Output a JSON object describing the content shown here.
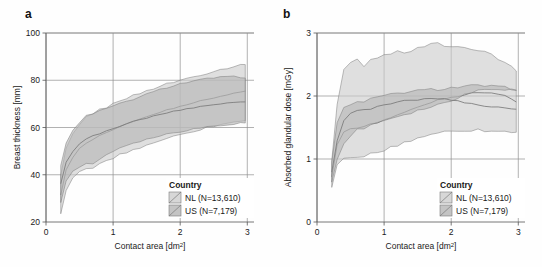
{
  "figure": {
    "panels": [
      {
        "letter": "a",
        "chart_data": {
          "type": "area",
          "title": "",
          "xlabel": "Contact area [dm²]",
          "ylabel": "Breast thickness [mm]",
          "xlim": [
            0,
            3.1
          ],
          "ylim": [
            20,
            100
          ],
          "xticks": [
            0,
            1,
            2,
            3
          ],
          "xtick_labels": [
            "0",
            "1",
            "2",
            "3"
          ],
          "yticks": [
            20,
            40,
            60,
            80,
            100
          ],
          "ytick_labels": [
            "20",
            "40",
            "60",
            "80",
            "100"
          ],
          "grid": true,
          "legend_position": "bottom-right",
          "x": [
            0.22,
            0.3,
            0.4,
            0.5,
            0.6,
            0.7,
            0.8,
            0.9,
            1.0,
            1.1,
            1.2,
            1.3,
            1.4,
            1.5,
            1.6,
            1.7,
            1.8,
            1.9,
            2.0,
            2.1,
            2.2,
            2.3,
            2.4,
            2.5,
            2.6,
            2.7,
            2.8,
            2.9,
            2.97
          ],
          "series": [
            {
              "name": "NL (N=13,610)",
              "median": [
                31.5,
                42.0,
                47.5,
                51.0,
                53.5,
                55.0,
                56.5,
                58.0,
                59.0,
                60.5,
                61.5,
                62.5,
                63.5,
                64.5,
                65.5,
                66.5,
                67.5,
                68.2,
                69.0,
                69.8,
                70.5,
                71.2,
                72.0,
                72.6,
                73.2,
                73.8,
                74.4,
                75.0,
                75.3
              ],
              "lower": [
                23.5,
                33.5,
                38.5,
                41.0,
                42.5,
                43.0,
                44.5,
                46.0,
                47.0,
                48.5,
                49.5,
                50.5,
                51.5,
                52.5,
                53.5,
                54.5,
                55.5,
                56.2,
                57.0,
                57.8,
                58.5,
                59.2,
                60.0,
                60.6,
                61.2,
                61.8,
                62.3,
                62.8,
                63.0
              ],
              "upper": [
                39.5,
                51.0,
                57.0,
                61.0,
                64.5,
                66.0,
                67.5,
                68.5,
                70.0,
                71.5,
                72.5,
                73.5,
                74.5,
                75.5,
                76.5,
                77.5,
                78.5,
                79.2,
                80.0,
                80.8,
                81.5,
                82.3,
                83.0,
                83.8,
                84.5,
                85.2,
                85.8,
                86.5,
                87.0
              ]
            },
            {
              "name": "US (N=7,179)",
              "median": [
                36.0,
                45.5,
                50.0,
                53.0,
                55.0,
                56.5,
                57.5,
                58.5,
                59.5,
                60.5,
                61.5,
                62.5,
                63.3,
                64.0,
                64.8,
                65.5,
                66.2,
                66.8,
                67.4,
                67.9,
                68.4,
                68.9,
                69.3,
                69.7,
                70.0,
                70.3,
                70.6,
                70.9,
                71.0
              ],
              "lower": [
                28.0,
                37.5,
                41.5,
                43.5,
                44.5,
                45.0,
                46.5,
                48.5,
                50.0,
                51.5,
                52.5,
                53.5,
                54.3,
                55.0,
                55.8,
                56.5,
                57.2,
                57.8,
                58.4,
                58.9,
                59.4,
                59.9,
                60.3,
                60.7,
                61.0,
                61.3,
                61.6,
                61.9,
                62.0
              ],
              "upper": [
                44.0,
                53.5,
                58.5,
                62.0,
                65.0,
                66.0,
                67.0,
                68.0,
                69.0,
                70.0,
                71.0,
                72.0,
                73.0,
                74.0,
                75.0,
                76.0,
                77.0,
                77.8,
                78.5,
                79.1,
                79.6,
                80.1,
                80.6,
                81.0,
                81.2,
                81.3,
                81.4,
                81.4,
                81.3
              ]
            }
          ]
        }
      },
      {
        "letter": "b",
        "chart_data": {
          "type": "area",
          "title": "",
          "xlabel": "Contact area [dm²]",
          "ylabel": "Absorbed glandular dose [mGy]",
          "xlim": [
            0,
            3.1
          ],
          "ylim": [
            0,
            3
          ],
          "xticks": [
            0,
            1,
            2,
            3
          ],
          "xtick_labels": [
            "0",
            "1",
            "2",
            "3"
          ],
          "yticks": [
            0,
            1,
            2,
            3
          ],
          "ytick_labels": [
            "0",
            "1",
            "2",
            "3"
          ],
          "grid": true,
          "legend_position": "bottom-right",
          "x": [
            0.22,
            0.3,
            0.4,
            0.5,
            0.6,
            0.7,
            0.8,
            0.9,
            1.0,
            1.1,
            1.2,
            1.3,
            1.4,
            1.5,
            1.6,
            1.7,
            1.8,
            1.9,
            2.0,
            2.1,
            2.2,
            2.3,
            2.4,
            2.5,
            2.6,
            2.7,
            2.8,
            2.9,
            2.97
          ],
          "series": [
            {
              "name": "NL (N=13,610)",
              "median": [
                0.72,
                1.22,
                1.44,
                1.47,
                1.5,
                1.52,
                1.55,
                1.58,
                1.62,
                1.66,
                1.7,
                1.74,
                1.78,
                1.82,
                1.86,
                1.9,
                1.94,
                1.96,
                1.98,
                2.0,
                2.02,
                2.04,
                2.06,
                2.06,
                2.05,
                2.03,
                2.0,
                1.95,
                1.9
              ],
              "lower": [
                0.55,
                0.92,
                1.0,
                1.0,
                1.02,
                1.05,
                1.08,
                1.1,
                1.14,
                1.18,
                1.22,
                1.26,
                1.3,
                1.33,
                1.36,
                1.4,
                1.42,
                1.43,
                1.44,
                1.45,
                1.46,
                1.46,
                1.46,
                1.45,
                1.44,
                1.44,
                1.44,
                1.43,
                1.43
              ],
              "upper": [
                0.95,
                1.85,
                2.4,
                2.52,
                2.58,
                2.48,
                2.56,
                2.62,
                2.64,
                2.68,
                2.74,
                2.66,
                2.72,
                2.76,
                2.8,
                2.84,
                2.83,
                2.8,
                2.78,
                2.78,
                2.77,
                2.76,
                2.74,
                2.72,
                2.66,
                2.6,
                2.54,
                2.46,
                2.42
              ]
            },
            {
              "name": "US (N=7,179)",
              "median": [
                0.78,
                1.3,
                1.62,
                1.72,
                1.76,
                1.78,
                1.8,
                1.83,
                1.86,
                1.88,
                1.9,
                1.92,
                1.93,
                1.94,
                1.95,
                1.96,
                1.96,
                1.95,
                1.94,
                1.92,
                1.9,
                1.88,
                1.86,
                1.84,
                1.83,
                1.82,
                1.81,
                1.8,
                1.8
              ],
              "lower": [
                0.62,
                1.0,
                1.24,
                1.38,
                1.46,
                1.5,
                1.54,
                1.58,
                1.62,
                1.65,
                1.68,
                1.71,
                1.74,
                1.77,
                1.8,
                1.83,
                1.86,
                1.9,
                1.94,
                1.98,
                2.02,
                2.06,
                2.09,
                2.11,
                2.12,
                2.12,
                2.11,
                2.1,
                2.1
              ],
              "upper": [
                0.95,
                1.58,
                1.8,
                1.86,
                1.9,
                1.92,
                1.95,
                1.98,
                2.0,
                2.02,
                2.04,
                2.06,
                2.07,
                2.08,
                2.09,
                2.1,
                2.11,
                2.12,
                2.13,
                2.14,
                2.15,
                2.16,
                2.16,
                2.16,
                2.15,
                2.14,
                2.13,
                2.12,
                2.11
              ]
            }
          ]
        }
      }
    ],
    "legend": {
      "title": "Country",
      "entries": [
        {
          "label": "NL (N=13,610)",
          "swatch_color": "#c9c9c9"
        },
        {
          "label": "US (N=7,179)",
          "swatch_color": "#b0b0b0"
        }
      ]
    },
    "colors": {
      "band_nl": "#cbcbcb",
      "band_us": "#b4b4b4",
      "line": "#7a7a7a",
      "grid": "#8f8f8f",
      "axis": "#555555",
      "text": "#1a1a1a"
    }
  }
}
